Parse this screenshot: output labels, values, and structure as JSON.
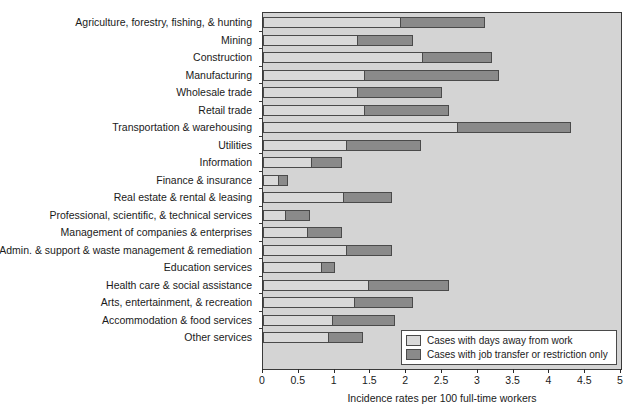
{
  "chart_data": {
    "type": "bar",
    "orientation": "horizontal",
    "stacked": true,
    "title": "",
    "xlabel": "Incidence rates per 100 full-time workers",
    "ylabel": "",
    "xlim": [
      0,
      5
    ],
    "xticks": [
      "0",
      "0.5",
      "1",
      "1.5",
      "2",
      "2.5",
      "3",
      "3.5",
      "4",
      "4.5",
      "5"
    ],
    "xtick_values": [
      0,
      0.5,
      1,
      1.5,
      2,
      2.5,
      3,
      3.5,
      4,
      4.5,
      5
    ],
    "grid": false,
    "legend_position": "bottom-right",
    "categories": [
      "Agriculture, forestry, fishing, & hunting",
      "Mining",
      "Construction",
      "Manufacturing",
      "Wholesale trade",
      "Retail trade",
      "Transportation & warehousing",
      "Utilities",
      "Information",
      "Finance & insurance",
      "Real estate & rental & leasing",
      "Professional, scientific, & technical services",
      "Management of companies & enterprises",
      "Admin. & support & waste management & remediation",
      "Education services",
      "Health care & social assistance",
      "Arts, entertainment, & recreation",
      "Accommodation & food services",
      "Other services"
    ],
    "series": [
      {
        "name": "Cases with days away from work",
        "color": "#d9d9d9",
        "values": [
          1.9,
          1.3,
          2.2,
          1.4,
          1.3,
          1.4,
          2.7,
          1.15,
          0.65,
          0.2,
          1.1,
          0.3,
          0.6,
          1.15,
          0.8,
          1.45,
          1.25,
          0.95,
          0.9
        ]
      },
      {
        "name": "Cases with job transfer or restriction only",
        "color": "#8a8a8a",
        "values": [
          1.2,
          0.8,
          1.0,
          1.9,
          1.2,
          1.2,
          1.6,
          1.05,
          0.45,
          0.15,
          0.7,
          0.35,
          0.5,
          0.65,
          0.2,
          1.15,
          0.85,
          0.9,
          0.5
        ]
      }
    ],
    "totals": [
      3.1,
      2.1,
      3.2,
      3.3,
      2.5,
      2.6,
      4.3,
      2.2,
      1.1,
      0.35,
      1.8,
      0.65,
      1.1,
      1.8,
      1.0,
      2.6,
      2.1,
      1.85,
      1.4
    ]
  },
  "legend": {
    "entries": [
      {
        "label": "Cases with days away from work",
        "swatch": "light"
      },
      {
        "label": "Cases with job transfer or restriction only",
        "swatch": "dark"
      }
    ]
  }
}
